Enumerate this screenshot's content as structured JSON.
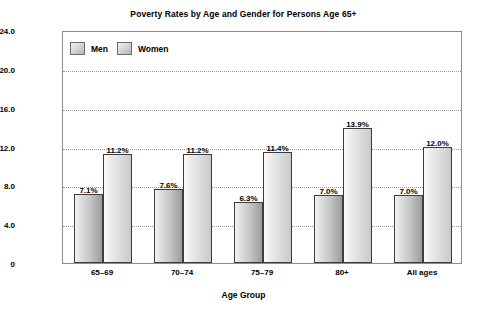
{
  "chart_data": {
    "type": "bar",
    "title": "Poverty Rates by Age and Gender for Persons Age 65+",
    "xlabel": "Age Group",
    "ylabel": "Percent of Population",
    "categories": [
      "65–69",
      "70–74",
      "75–79",
      "80+",
      "All ages"
    ],
    "series": [
      {
        "name": "Men",
        "values": [
          7.1,
          7.6,
          6.3,
          7.0,
          7.0
        ],
        "labels": [
          "7.1%",
          "7.6%",
          "6.3%",
          "7.0%",
          "7.0%"
        ]
      },
      {
        "name": "Women",
        "values": [
          11.2,
          11.2,
          11.4,
          13.9,
          12.0
        ],
        "labels": [
          "11.2%",
          "11.2%",
          "11.4%",
          "13.9%",
          "12.0%"
        ]
      }
    ],
    "ylim": [
      0,
      24
    ],
    "yticks": [
      0,
      4,
      8,
      12,
      16,
      20,
      24
    ],
    "ytick_labels": [
      "0",
      "4.0",
      "8.0",
      "12.0",
      "16.0",
      "20.0",
      "24.0"
    ],
    "gridlines": [
      4,
      8,
      12,
      16,
      20
    ],
    "grid": true,
    "legend_position": "top-left-inside",
    "colors": {
      "men_fill_light": "#f2f2f2",
      "men_fill_dark": "#9b9b9b",
      "women_fill_light": "#fbfbfb",
      "women_fill_dark": "#c9c9c9",
      "bar_border": "#3c3c3c",
      "frame": "#8c8c8c",
      "grid": "#9a9a9a",
      "text": "#000000",
      "background": "#ffffff"
    }
  },
  "legend": {
    "items": [
      {
        "label": "Men"
      },
      {
        "label": "Women"
      }
    ]
  }
}
